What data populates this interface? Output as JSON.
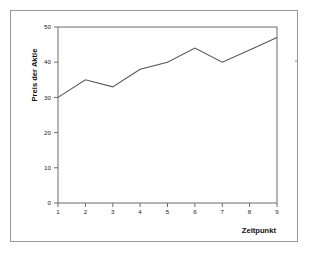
{
  "chart_data": {
    "type": "line",
    "title": "",
    "xlabel": "Zeitpunkt",
    "ylabel": "Preis der Aktie",
    "x": [
      1,
      2,
      3,
      4,
      5,
      6,
      7,
      8,
      9
    ],
    "values": [
      30,
      35,
      33,
      38,
      40,
      44,
      40,
      43.5,
      47
    ],
    "xticks": [
      "1",
      "2",
      "3",
      "4",
      "5",
      "6",
      "7",
      "8",
      "9"
    ],
    "yticks": [
      "0",
      "10",
      "20",
      "30",
      "40",
      "50"
    ],
    "ytick_values": [
      0,
      10,
      20,
      30,
      40,
      50
    ],
    "xlim": [
      1,
      9
    ],
    "ylim": [
      0,
      50
    ],
    "grid": false,
    "legend": null,
    "line_color": "#55555c",
    "axis_color": "#6b6b6b",
    "background": "#ffffff",
    "frame_color": "#9a9a9a"
  },
  "figure": {
    "border_label": "figure-border",
    "caption_fragment": ""
  }
}
